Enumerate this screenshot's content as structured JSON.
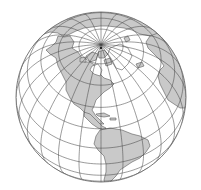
{
  "map": {
    "projection": "orthographic",
    "view_center": {
      "lat": 52,
      "lon": -75
    },
    "graticule_step_deg": 15,
    "colors": {
      "ocean": "#ffffff",
      "land": "#c9c9c9",
      "coastline": "#5a5a5a",
      "graticule": "#4a4a4a",
      "globe_outline": "#6a6a6a"
    },
    "features": [
      "north-pole",
      "arctic-ocean",
      "canadian-arctic-archipelago",
      "greenland",
      "eurasia",
      "europe",
      "africa",
      "north-america",
      "central-america",
      "caribbean-islands",
      "south-america"
    ]
  }
}
